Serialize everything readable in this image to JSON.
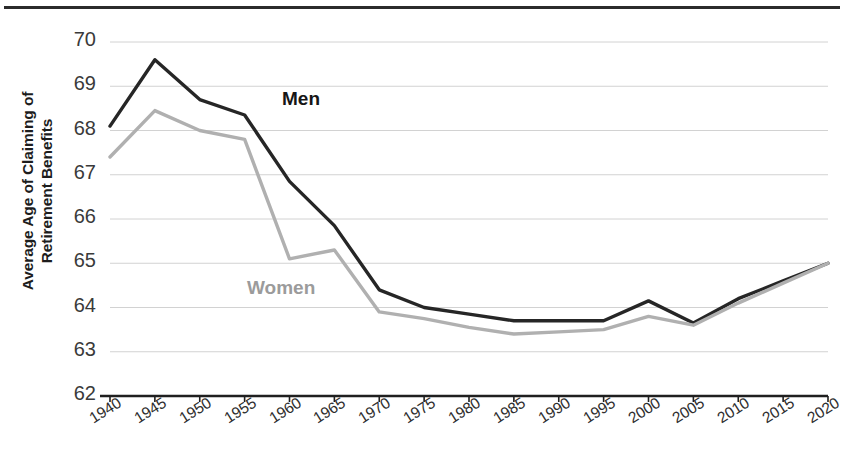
{
  "chart_data": {
    "type": "line",
    "title": "",
    "xlabel": "",
    "ylabel": "Average Age of Claiming of Retirement Benefits",
    "ylabel_line1": "Average Age of Claiming of",
    "ylabel_line2": "Retirement Benefits",
    "categories": [
      "1940",
      "1945",
      "1950",
      "1955",
      "1960",
      "1965",
      "1970",
      "1975",
      "1980",
      "1985",
      "1990",
      "1995",
      "2000",
      "2005",
      "2010",
      "2015",
      "2020"
    ],
    "ytick_labels": [
      "70",
      "69",
      "68",
      "67",
      "66",
      "65",
      "64",
      "63",
      "62"
    ],
    "ylim": [
      62,
      70
    ],
    "yticks": [
      62,
      63,
      64,
      65,
      66,
      67,
      68,
      69,
      70
    ],
    "grid": true,
    "legend_position": "inline-annotation",
    "series": [
      {
        "name": "Men",
        "color": "#262626",
        "label_color": "#161616",
        "values": [
          68.1,
          69.6,
          68.7,
          68.35,
          66.85,
          65.85,
          64.4,
          64.0,
          63.85,
          63.7,
          63.7,
          63.7,
          64.15,
          63.65,
          64.2,
          64.6,
          65.0
        ]
      },
      {
        "name": "Women",
        "color": "#b0b0b0",
        "label_color": "#9b9b9b",
        "values": [
          67.4,
          68.45,
          68.0,
          67.8,
          65.1,
          65.3,
          63.9,
          63.75,
          63.55,
          63.4,
          63.45,
          63.5,
          63.8,
          63.6,
          64.1,
          64.55,
          65.0
        ]
      }
    ],
    "annotations": [
      {
        "text": "Men",
        "series": "Men",
        "x_px": 282,
        "y_px": 88
      },
      {
        "text": "Women",
        "series": "Women",
        "x_px": 247,
        "y_px": 277
      }
    ]
  },
  "axes_geometry": {
    "plot_left": 110,
    "plot_right": 828,
    "plot_top": 42,
    "plot_bottom": 396
  }
}
